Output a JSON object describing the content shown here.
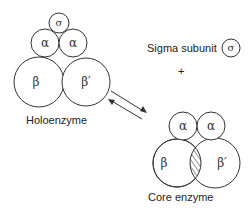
{
  "holoenzyme": {
    "label": "Holoenzyme",
    "subunits": {
      "sigma": "σ",
      "alpha_left": "α",
      "alpha_right": "α",
      "beta": "β",
      "beta_prime": "β′"
    }
  },
  "sigma_free": {
    "label": "Sigma subunit",
    "symbol": "σ",
    "plus": "+"
  },
  "core_enzyme": {
    "label": "Core enzyme",
    "subunits": {
      "alpha_left": "α",
      "alpha_right": "α",
      "beta": "β",
      "beta_prime": "β′"
    }
  },
  "colors": {
    "stroke": "#333333",
    "background": "#ffffff"
  }
}
